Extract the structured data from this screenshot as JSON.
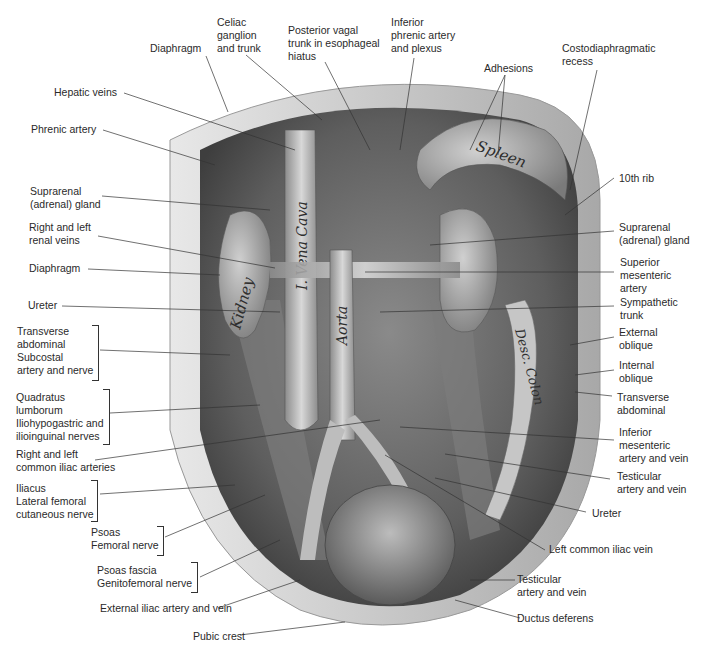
{
  "figure": {
    "type": "anatomical illustration",
    "organ_labels": {
      "kidney": "Kidney",
      "vena_cava": "I. Vena Cava",
      "aorta": "Aorta",
      "spleen": "Spleen",
      "desc_colon": "Desc. Colon"
    },
    "colors": {
      "background": "#ffffff",
      "tissue_dark": "#5a5a5a",
      "tissue_mid": "#9a9a9a",
      "tissue_light": "#d4d4d4",
      "leader_line": "#333333",
      "label_text": "#2a2a2a"
    }
  },
  "labels": {
    "top": [
      {
        "id": "diaphragm-top",
        "text": "Diaphragm"
      },
      {
        "id": "celiac",
        "text": "Celiac\nganglion\nand trunk"
      },
      {
        "id": "posterior-vagal",
        "text": "Posterior vagal\ntrunk in esophageal\nhiatus"
      },
      {
        "id": "inferior-phrenic",
        "text": "Inferior\nphrenic artery\nand plexus"
      },
      {
        "id": "adhesions",
        "text": "Adhesions"
      },
      {
        "id": "costodiaphragmatic",
        "text": "Costodiaphragmatic\nrecess"
      }
    ],
    "left": [
      {
        "id": "hepatic-veins",
        "text": "Hepatic veins"
      },
      {
        "id": "phrenic-artery",
        "text": "Phrenic artery"
      },
      {
        "id": "suprarenal-left",
        "text": "Suprarenal\n(adrenal) gland"
      },
      {
        "id": "renal-veins",
        "text": "Right and left\nrenal veins"
      },
      {
        "id": "diaphragm-left",
        "text": "Diaphragm"
      },
      {
        "id": "ureter-left",
        "text": "Ureter"
      },
      {
        "id": "transverse-subcostal",
        "text": "Transverse\nabdominal\nSubcostal\nartery and nerve"
      },
      {
        "id": "quadratus",
        "text": "Quadratus\nlumborum\nIliohypogastric and\nilioinguinal nerves"
      },
      {
        "id": "common-iliac-arteries",
        "text": "Right and left\ncommon iliac arteries"
      },
      {
        "id": "iliacus",
        "text": "Iliacus\nLateral femoral\ncutaneous nerve"
      },
      {
        "id": "psoas",
        "text": "Psoas\nFemoral nerve"
      },
      {
        "id": "psoas-fascia",
        "text": "Psoas fascia\nGenitofemoral nerve"
      },
      {
        "id": "external-iliac",
        "text": "External iliac artery and vein"
      },
      {
        "id": "pubic-crest",
        "text": "Pubic crest"
      }
    ],
    "right": [
      {
        "id": "tenth-rib",
        "text": "10th rib"
      },
      {
        "id": "suprarenal-right",
        "text": "Suprarenal\n(adrenal) gland"
      },
      {
        "id": "superior-mesenteric",
        "text": "Superior\nmesenteric\nartery"
      },
      {
        "id": "sympathetic",
        "text": "Sympathetic\ntrunk"
      },
      {
        "id": "external-oblique",
        "text": "External\noblique"
      },
      {
        "id": "internal-oblique",
        "text": "Internal\noblique"
      },
      {
        "id": "transverse-right",
        "text": "Transverse\nabdominal"
      },
      {
        "id": "inferior-mesenteric",
        "text": "Inferior\nmesenteric\nartery and vein"
      },
      {
        "id": "testicular-1",
        "text": "Testicular\nartery and vein"
      },
      {
        "id": "ureter-right",
        "text": "Ureter"
      },
      {
        "id": "left-common-iliac-vein",
        "text": "Left common iliac vein"
      },
      {
        "id": "testicular-2",
        "text": "Testicular\nartery and vein"
      },
      {
        "id": "ductus",
        "text": "Ductus deferens"
      }
    ]
  }
}
